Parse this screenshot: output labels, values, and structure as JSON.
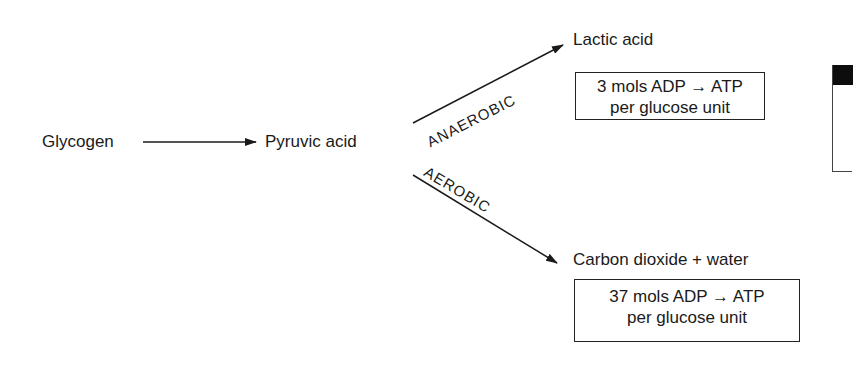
{
  "diagram": {
    "nodes": {
      "glycogen": "Glycogen",
      "pyruvic_acid": "Pyruvic acid",
      "lactic_acid": "Lactic acid",
      "co2_water": "Carbon dioxide + water"
    },
    "pathways": {
      "anaerobic": "ANAEROBIC",
      "aerobic": "AEROBIC"
    },
    "yields": {
      "anaerobic": {
        "line1": "3 mols ADP → ATP",
        "line2": "per glucose unit"
      },
      "aerobic": {
        "line1": "37 mols ADP → ATP",
        "line2": "per glucose unit"
      }
    }
  }
}
